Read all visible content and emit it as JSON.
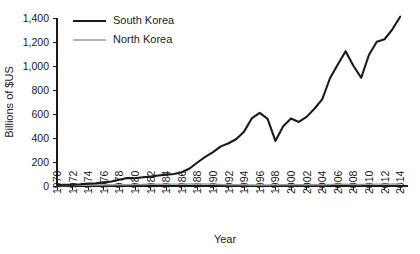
{
  "chart_data": {
    "type": "line",
    "title": "",
    "xlabel": "Year",
    "ylabel": "Billions of $US",
    "xlim": [
      1970,
      2015
    ],
    "ylim": [
      0,
      1400
    ],
    "grid": false,
    "legend_position": "top-left",
    "x_tick_labels": [
      "1970",
      "1972",
      "1974",
      "1976",
      "1978",
      "1980",
      "1982",
      "1984",
      "1986",
      "1988",
      "1990",
      "1992",
      "1994",
      "1996",
      "1998",
      "2000",
      "2002",
      "2004",
      "2006",
      "2008",
      "2010",
      "2012",
      "2014"
    ],
    "y_tick_labels": [
      "0",
      "200",
      "400",
      "600",
      "800",
      "1,000",
      "1,200",
      "1,400"
    ],
    "y_tick_values": [
      0,
      200,
      400,
      600,
      800,
      1000,
      1200,
      1400
    ],
    "x": [
      1970,
      1971,
      1972,
      1973,
      1974,
      1975,
      1976,
      1977,
      1978,
      1979,
      1980,
      1981,
      1982,
      1983,
      1984,
      1985,
      1986,
      1987,
      1988,
      1989,
      1990,
      1991,
      1992,
      1993,
      1994,
      1995,
      1996,
      1997,
      1998,
      1999,
      2000,
      2001,
      2002,
      2003,
      2004,
      2005,
      2006,
      2007,
      2008,
      2009,
      2010,
      2011,
      2012,
      2013,
      2014
    ],
    "series": [
      {
        "name": "South Korea",
        "color": "#1a1a1a",
        "values": [
          9,
          10,
          11,
          14,
          20,
          22,
          30,
          38,
          52,
          66,
          65,
          73,
          78,
          88,
          95,
          100,
          115,
          146,
          196,
          243,
          283,
          330,
          356,
          392,
          455,
          566,
          610,
          560,
          376,
          497,
          562,
          534,
          576,
          644,
          722,
          898,
          1012,
          1123,
          1002,
          902,
          1094,
          1202,
          1223,
          1306,
          1411
        ]
      },
      {
        "name": "North Korea",
        "color": "#9a9a9a",
        "values": [
          4,
          4,
          5,
          5,
          6,
          7,
          8,
          9,
          10,
          11,
          12,
          13,
          14,
          15,
          16,
          16,
          16,
          17,
          17,
          17,
          16,
          12,
          11,
          10,
          9,
          8,
          8,
          8,
          9,
          10,
          11,
          11,
          11,
          11,
          11,
          13,
          14,
          14,
          13,
          12,
          14,
          16,
          16,
          17,
          17
        ]
      }
    ]
  },
  "legend": {
    "items": [
      {
        "label": "South Korea",
        "swatch": "thick-black-line"
      },
      {
        "label": "North Korea",
        "swatch": "thin-gray-line"
      }
    ]
  }
}
